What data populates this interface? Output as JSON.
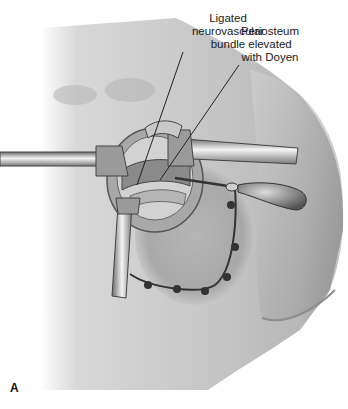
{
  "figure": {
    "panel_letter": "A",
    "labels": {
      "neurovascular": [
        "Ligated",
        "neurovascular",
        "bundle"
      ],
      "periosteum": [
        "Periosteum",
        "elevated",
        "with Doyen"
      ]
    },
    "colors": {
      "skin_light": "#e2e2e2",
      "skin_mid": "#bdbdbd",
      "skin_dark": "#8f8f8f",
      "outline": "#3a3a3a",
      "suture": "#333333"
    }
  }
}
